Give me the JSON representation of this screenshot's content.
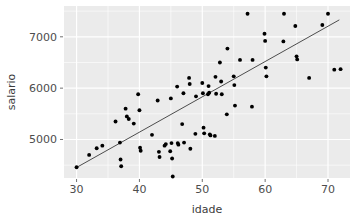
{
  "chart_data": {
    "type": "scatter",
    "title": "",
    "subtitle": "",
    "xlabel": "idade",
    "ylabel": "salario",
    "xlim": [
      28.0,
      73.5
    ],
    "ylim": [
      4250,
      7600
    ],
    "xticks": [
      30,
      40,
      50,
      60,
      70
    ],
    "xticklabels": [
      "30",
      "40",
      "50",
      "60",
      "70"
    ],
    "yticks": [
      5000,
      6000,
      7000
    ],
    "yticklabels": [
      "5000",
      "6000",
      "7000"
    ],
    "grid": true,
    "grid_color": "#ffffff",
    "panel_background": "#ebebeb",
    "point_color": "#000000",
    "point_size": 3.0,
    "legend": null,
    "legend_position": "none",
    "annotations": [],
    "series": [
      {
        "name": "observations",
        "type": "scatter",
        "points": [
          [
            30.0,
            4460
          ],
          [
            32.0,
            4700
          ],
          [
            33.2,
            4830
          ],
          [
            34.1,
            4880
          ],
          [
            36.2,
            5350
          ],
          [
            36.9,
            4940
          ],
          [
            37.0,
            4610
          ],
          [
            37.1,
            4480
          ],
          [
            37.8,
            5600
          ],
          [
            38.0,
            5450
          ],
          [
            38.3,
            5400
          ],
          [
            39.1,
            5310
          ],
          [
            39.8,
            5880
          ],
          [
            40.0,
            5570
          ],
          [
            40.1,
            4840
          ],
          [
            40.2,
            4780
          ],
          [
            42.0,
            5090
          ],
          [
            42.9,
            5760
          ],
          [
            43.1,
            4760
          ],
          [
            43.2,
            4660
          ],
          [
            44.0,
            4880
          ],
          [
            44.2,
            4910
          ],
          [
            44.9,
            4770
          ],
          [
            45.0,
            5800
          ],
          [
            45.1,
            4930
          ],
          [
            45.2,
            4630
          ],
          [
            45.3,
            4280
          ],
          [
            46.0,
            6030
          ],
          [
            46.1,
            4930
          ],
          [
            46.2,
            4900
          ],
          [
            46.8,
            5300
          ],
          [
            47.0,
            5900
          ],
          [
            47.1,
            4940
          ],
          [
            47.9,
            6200
          ],
          [
            48.0,
            6080
          ],
          [
            48.1,
            4820
          ],
          [
            48.9,
            5110
          ],
          [
            49.0,
            5840
          ],
          [
            50.0,
            6100
          ],
          [
            50.1,
            5900
          ],
          [
            50.2,
            5230
          ],
          [
            50.3,
            5120
          ],
          [
            50.9,
            5880
          ],
          [
            51.0,
            6040
          ],
          [
            51.1,
            5910
          ],
          [
            51.2,
            5100
          ],
          [
            51.3,
            5080
          ],
          [
            52.0,
            5070
          ],
          [
            52.1,
            6220
          ],
          [
            52.2,
            5890
          ],
          [
            52.8,
            6500
          ],
          [
            53.0,
            6130
          ],
          [
            53.1,
            5880
          ],
          [
            53.9,
            5490
          ],
          [
            54.0,
            6770
          ],
          [
            55.0,
            6230
          ],
          [
            55.1,
            6060
          ],
          [
            55.2,
            5660
          ],
          [
            56.0,
            6550
          ],
          [
            57.2,
            7450
          ],
          [
            57.9,
            5640
          ],
          [
            58.0,
            6550
          ],
          [
            59.9,
            7060
          ],
          [
            60.0,
            6920
          ],
          [
            60.1,
            6400
          ],
          [
            60.2,
            6230
          ],
          [
            62.9,
            6910
          ],
          [
            63.0,
            7450
          ],
          [
            64.8,
            7210
          ],
          [
            65.0,
            6620
          ],
          [
            65.1,
            6560
          ],
          [
            67.0,
            6200
          ],
          [
            69.1,
            7230
          ],
          [
            70.0,
            7450
          ],
          [
            71.0,
            6360
          ],
          [
            72.0,
            6370
          ]
        ]
      },
      {
        "name": "regression-line",
        "type": "line",
        "color": "#4d4d4d",
        "width": 1.0,
        "endpoints": [
          [
            30.0,
            4455
          ],
          [
            71.8,
            7330
          ]
        ]
      }
    ]
  }
}
